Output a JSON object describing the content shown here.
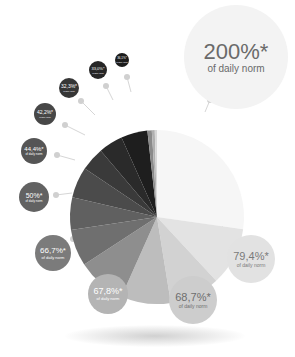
{
  "chart_data": {
    "type": "pie",
    "title": "",
    "subtitle_suffix": "of daily norm",
    "center": [
      157,
      217
    ],
    "radius": 87,
    "slices": [
      {
        "label": "200%*",
        "value": 200,
        "color": "#f6f6f6"
      },
      {
        "label": "79,4%*",
        "value": 79.4,
        "color": "#e3e3e3"
      },
      {
        "label": "68,7%*",
        "value": 68.7,
        "color": "#d2d2d2"
      },
      {
        "label": "67,8%*",
        "value": 67.8,
        "color": "#bdbdbd"
      },
      {
        "label": "66,7%*",
        "value": 66.7,
        "color": "#8e8e8e"
      },
      {
        "label": "50%*",
        "value": 50,
        "color": "#6f6f6f"
      },
      {
        "label": "44,4%*",
        "value": 44.4,
        "color": "#606060"
      },
      {
        "label": "42,2%*",
        "value": 42.2,
        "color": "#4b4b4b"
      },
      {
        "label": "32,3%*",
        "value": 32.3,
        "color": "#3a3a3a"
      },
      {
        "label": "33,0%*",
        "value": 33.0,
        "color": "#2a2a2a"
      },
      {
        "label": "36,1%*",
        "value": 36.1,
        "color": "#1e1e1e"
      },
      {
        "label": "",
        "value": 6,
        "color": "#8a8a8a"
      },
      {
        "label": "",
        "value": 4,
        "color": "#b0b0b0"
      },
      {
        "label": "",
        "value": 3,
        "color": "#d8d8d8"
      }
    ],
    "legend": "none",
    "grid": false
  },
  "bubbles": [
    {
      "value": "200%*",
      "sub": "of daily norm",
      "x": 236,
      "y": 57,
      "r": 52,
      "bg": "#f3f3f3",
      "fg": "#6a6a6a",
      "vs": 22,
      "ss": 10,
      "dot": [
        210,
        100
      ],
      "anchor": [
        205,
        112
      ]
    },
    {
      "value": "79,4%*",
      "sub": "of daily norm",
      "x": 251,
      "y": 259,
      "r": 24,
      "bg": "#e2e2e2",
      "fg": "#7a7a7a",
      "vs": 11,
      "ss": 5,
      "dot": [
        232,
        238
      ],
      "anchor": [
        222,
        226
      ]
    },
    {
      "value": "68,7%*",
      "sub": "of daily norm",
      "x": 193,
      "y": 300,
      "r": 24,
      "bg": "#cdcdcd",
      "fg": "#6e6e6e",
      "vs": 11,
      "ss": 5,
      "dot": [
        186,
        275
      ],
      "anchor": [
        182,
        262
      ]
    },
    {
      "value": "67,8%*",
      "sub": "of daily norm",
      "x": 108,
      "y": 294,
      "r": 20,
      "bg": "#b4b4b4",
      "fg": "#ffffff",
      "vs": 9,
      "ss": 4,
      "dot": [
        117,
        270
      ],
      "anchor": [
        120,
        258
      ]
    },
    {
      "value": "66,7%*",
      "sub": "of daily norm",
      "x": 53,
      "y": 253,
      "r": 18,
      "bg": "#7b7b7b",
      "fg": "#ffffff",
      "vs": 8,
      "ss": 4,
      "dot": [
        73,
        239
      ],
      "anchor": [
        85,
        230
      ]
    },
    {
      "value": "50%*",
      "sub": "of daily norm",
      "x": 34,
      "y": 197,
      "r": 15,
      "bg": "#626262",
      "fg": "#ffffff",
      "vs": 7,
      "ss": 3,
      "dot": [
        56,
        195
      ],
      "anchor": [
        72,
        193
      ]
    },
    {
      "value": "44,4%*",
      "sub": "of daily norm",
      "x": 34,
      "y": 151,
      "r": 13,
      "bg": "#555555",
      "fg": "#ffffff",
      "vs": 6,
      "ss": 3,
      "dot": [
        57,
        155
      ],
      "anchor": [
        75,
        160
      ]
    },
    {
      "value": "42,2%*",
      "sub": "of daily norm",
      "x": 45,
      "y": 114,
      "r": 11,
      "bg": "#474747",
      "fg": "#ffffff",
      "vs": 5,
      "ss": 2,
      "dot": [
        65,
        125
      ],
      "anchor": [
        85,
        135
      ]
    },
    {
      "value": "32,3%*",
      "sub": "of daily norm",
      "x": 69,
      "y": 88,
      "r": 10,
      "bg": "#363636",
      "fg": "#ffffff",
      "vs": 5,
      "ss": 2,
      "dot": [
        81,
        101
      ],
      "anchor": [
        95,
        115
      ]
    },
    {
      "value": "33,0%*",
      "sub": "of daily norm",
      "x": 98,
      "y": 70,
      "r": 9,
      "bg": "#262626",
      "fg": "#ffffff",
      "vs": 4,
      "ss": 2,
      "dot": [
        106,
        86
      ],
      "anchor": [
        113,
        100
      ]
    },
    {
      "value": "36,1%*",
      "sub": "of daily norm",
      "x": 122,
      "y": 60,
      "r": 7,
      "bg": "#1c1c1c",
      "fg": "#ffffff",
      "vs": 3,
      "ss": 2,
      "dot": [
        127,
        77
      ],
      "anchor": [
        131,
        92
      ]
    }
  ]
}
